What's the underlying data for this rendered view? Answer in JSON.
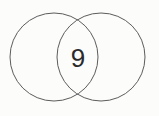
{
  "figure": {
    "type": "venn-diagram",
    "background_color": "#fcfcfb",
    "stroke_color": "#5c5c5c",
    "label_color": "#2b2b2b",
    "regions": {
      "intersection_label": "9",
      "left_only_label": "",
      "right_only_label": ""
    },
    "circles": [
      {
        "name": "left-circle",
        "cx": 54,
        "cy": 57,
        "r": 44,
        "label": ""
      },
      {
        "name": "right-circle",
        "cx": 101,
        "cy": 57,
        "r": 44,
        "label": ""
      }
    ],
    "lens": {
      "center_x": 78,
      "center_y": 58,
      "value": "9"
    }
  }
}
